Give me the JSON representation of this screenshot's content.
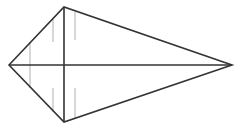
{
  "diagram": {
    "shape": "kite",
    "vertices": {
      "left": [
        9,
        65
      ],
      "top": [
        64,
        7
      ],
      "right": [
        232,
        65
      ],
      "bottom": [
        64,
        122
      ]
    },
    "diagonals": [
      {
        "from": "top",
        "to": "bottom"
      },
      {
        "from": "left",
        "to": "right"
      }
    ],
    "guide_lines": [
      {
        "x": 30,
        "y1": 42,
        "y2": 88
      },
      {
        "x": 53,
        "y1": 18,
        "y2": 42
      },
      {
        "x": 53,
        "y1": 88,
        "y2": 112
      },
      {
        "x": 75,
        "y1": 12,
        "y2": 40
      },
      {
        "x": 75,
        "y1": 88,
        "y2": 118
      }
    ],
    "colors": {
      "stroke": "#333333",
      "guide": "#bdbdbd",
      "background": "#ffffff"
    }
  }
}
